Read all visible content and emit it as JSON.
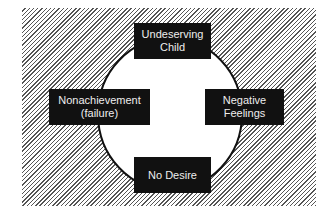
{
  "diagram": {
    "type": "cycle",
    "nodes": [
      {
        "id": "top",
        "line1": "Undeserving",
        "line2": "Child"
      },
      {
        "id": "right",
        "line1": "Negative",
        "line2": "Feelings"
      },
      {
        "id": "bottom",
        "line1": "No Desire",
        "line2": ""
      },
      {
        "id": "left",
        "line1": "Nonachievement",
        "line2": "(failure)"
      }
    ],
    "colors": {
      "box": "#111111",
      "text": "#eeeeee",
      "hatch": "#555555",
      "circle_fill": "#ffffff",
      "stroke": "#111111"
    }
  }
}
